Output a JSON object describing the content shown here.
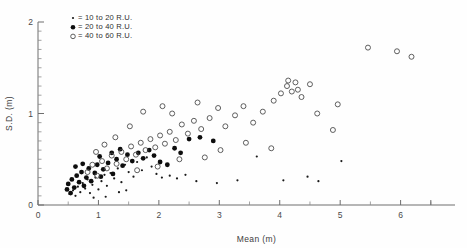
{
  "figure": {
    "title": "",
    "background": "#fefefe",
    "ink_color": "#3a3a3a"
  },
  "axes": {
    "x_title": "Mean (m)",
    "y_title": "S.D. (m)",
    "x_ticks": [
      "0",
      "1",
      "2",
      "3",
      "4",
      "5",
      "6"
    ],
    "y_ticks": [
      "0",
      "1",
      "2"
    ],
    "x_minor_step": "0.5",
    "y_minor_step": "0.1"
  },
  "legend": {
    "items": [
      {
        "marker": "small-dot",
        "label": "= 10 to 20 R.U."
      },
      {
        "marker": "filled-circle",
        "label": "= 20 to 40 R.U."
      },
      {
        "marker": "open-circle",
        "label": "= 40 to 60 R.U."
      }
    ]
  },
  "chart_data": {
    "type": "scatter",
    "title": "",
    "xlabel": "Mean (m)",
    "ylabel": "S.D. (m)",
    "xlim": [
      0,
      6.9
    ],
    "ylim": [
      0,
      2.0
    ],
    "grid": false,
    "legend_position": "top-left-inside",
    "series": [
      {
        "name": "10 to 20 R.U.",
        "marker": "small-dot",
        "color": "#1a1a1a",
        "points": [
          [
            0.52,
            0.12
          ],
          [
            0.58,
            0.16
          ],
          [
            0.62,
            0.1
          ],
          [
            0.66,
            0.2
          ],
          [
            0.7,
            0.14
          ],
          [
            0.74,
            0.24
          ],
          [
            0.78,
            0.18
          ],
          [
            0.82,
            0.28
          ],
          [
            0.86,
            0.13
          ],
          [
            0.9,
            0.22
          ],
          [
            0.95,
            0.3
          ],
          [
            1.0,
            0.17
          ],
          [
            1.05,
            0.26
          ],
          [
            1.1,
            0.33
          ],
          [
            1.14,
            0.21
          ],
          [
            1.2,
            0.35
          ],
          [
            1.26,
            0.29
          ],
          [
            1.32,
            0.4
          ],
          [
            1.38,
            0.25
          ],
          [
            1.44,
            0.44
          ],
          [
            1.5,
            0.36
          ],
          [
            1.58,
            0.31
          ],
          [
            1.64,
            0.47
          ],
          [
            1.72,
            0.38
          ],
          [
            1.8,
            0.52
          ],
          [
            1.88,
            0.42
          ],
          [
            1.96,
            0.34
          ],
          [
            2.05,
            0.3
          ],
          [
            2.18,
            0.32
          ],
          [
            2.3,
            0.29
          ],
          [
            2.44,
            0.33
          ],
          [
            2.62,
            0.26
          ],
          [
            2.96,
            0.24
          ],
          [
            3.3,
            0.27
          ],
          [
            4.06,
            0.27
          ],
          [
            4.46,
            0.31
          ],
          [
            4.64,
            0.26
          ],
          [
            5.02,
            0.48
          ],
          [
            1.34,
            0.14
          ],
          [
            1.46,
            0.16
          ],
          [
            0.92,
            0.08
          ],
          [
            1.12,
            0.09
          ],
          [
            3.62,
            0.53
          ]
        ]
      },
      {
        "name": "20 to 40 R.U.",
        "marker": "filled-circle",
        "color": "#0d0d0d",
        "points": [
          [
            0.48,
            0.17
          ],
          [
            0.5,
            0.23
          ],
          [
            0.54,
            0.13
          ],
          [
            0.56,
            0.28
          ],
          [
            0.6,
            0.19
          ],
          [
            0.64,
            0.32
          ],
          [
            0.68,
            0.25
          ],
          [
            0.72,
            0.36
          ],
          [
            0.76,
            0.21
          ],
          [
            0.8,
            0.3
          ],
          [
            0.84,
            0.4
          ],
          [
            0.88,
            0.26
          ],
          [
            0.94,
            0.35
          ],
          [
            0.98,
            0.44
          ],
          [
            1.04,
            0.31
          ],
          [
            1.08,
            0.39
          ],
          [
            1.16,
            0.46
          ],
          [
            1.24,
            0.34
          ],
          [
            1.3,
            0.5
          ],
          [
            1.4,
            0.43
          ],
          [
            1.48,
            0.55
          ],
          [
            1.56,
            0.48
          ],
          [
            1.66,
            0.57
          ],
          [
            1.74,
            0.51
          ],
          [
            1.84,
            0.6
          ],
          [
            1.92,
            0.54
          ],
          [
            2.02,
            0.47
          ],
          [
            2.14,
            0.44
          ],
          [
            2.26,
            0.62
          ],
          [
            2.36,
            0.57
          ],
          [
            2.5,
            0.72
          ],
          [
            2.68,
            0.74
          ],
          [
            2.9,
            0.7
          ],
          [
            0.62,
            0.42
          ],
          [
            0.74,
            0.45
          ],
          [
            1.02,
            0.53
          ],
          [
            1.22,
            0.57
          ],
          [
            1.36,
            0.61
          ]
        ]
      },
      {
        "name": "40 to 60 R.U.",
        "marker": "open-circle",
        "color": "#4d4d4d",
        "points": [
          [
            0.82,
            0.36
          ],
          [
            0.9,
            0.44
          ],
          [
            0.98,
            0.32
          ],
          [
            1.06,
            0.48
          ],
          [
            1.14,
            0.4
          ],
          [
            1.22,
            0.54
          ],
          [
            1.3,
            0.45
          ],
          [
            1.38,
            0.58
          ],
          [
            1.46,
            0.5
          ],
          [
            1.54,
            0.64
          ],
          [
            1.62,
            0.55
          ],
          [
            1.7,
            0.68
          ],
          [
            1.78,
            0.6
          ],
          [
            1.86,
            0.72
          ],
          [
            1.94,
            0.63
          ],
          [
            2.02,
            0.76
          ],
          [
            2.1,
            0.67
          ],
          [
            2.18,
            0.8
          ],
          [
            2.28,
            0.71
          ],
          [
            2.38,
            0.88
          ],
          [
            2.48,
            0.78
          ],
          [
            2.58,
            0.92
          ],
          [
            2.7,
            0.83
          ],
          [
            2.84,
            0.95
          ],
          [
            2.98,
            1.06
          ],
          [
            3.1,
            0.86
          ],
          [
            3.26,
            0.98
          ],
          [
            3.4,
            1.08
          ],
          [
            3.56,
            0.9
          ],
          [
            3.72,
            1.02
          ],
          [
            3.9,
            1.14
          ],
          [
            4.02,
            1.22
          ],
          [
            4.12,
            1.3
          ],
          [
            4.2,
            1.24
          ],
          [
            4.3,
            1.26
          ],
          [
            4.36,
            1.18
          ],
          [
            4.5,
            1.32
          ],
          [
            4.62,
            1.0
          ],
          [
            4.88,
            0.82
          ],
          [
            4.96,
            1.1
          ],
          [
            5.46,
            1.72
          ],
          [
            5.94,
            1.68
          ],
          [
            6.18,
            1.62
          ],
          [
            3.02,
            0.6
          ],
          [
            3.44,
            0.68
          ],
          [
            2.22,
            1.0
          ],
          [
            2.06,
            1.08
          ],
          [
            1.74,
            1.02
          ],
          [
            1.52,
            0.86
          ],
          [
            1.28,
            0.74
          ],
          [
            1.1,
            0.66
          ],
          [
            0.96,
            0.58
          ],
          [
            2.64,
            1.12
          ],
          [
            2.34,
            0.5
          ],
          [
            1.98,
            0.42
          ],
          [
            1.64,
            0.38
          ],
          [
            4.14,
            1.36
          ],
          [
            4.26,
            1.34
          ],
          [
            3.86,
            0.62
          ],
          [
            2.76,
            0.52
          ]
        ]
      }
    ]
  }
}
